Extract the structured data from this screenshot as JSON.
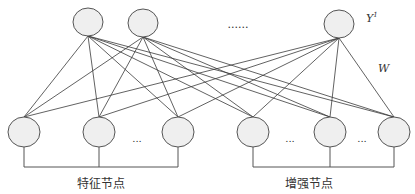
{
  "diagram": {
    "top_layer": {
      "label": "Y¹",
      "label_main": "Y",
      "label_sup": "1",
      "ellipsis": "......",
      "nodes": [
        {
          "cx": 88,
          "cy": 22
        },
        {
          "cx": 143,
          "cy": 23
        },
        {
          "cx": 339,
          "cy": 24
        }
      ]
    },
    "weights_label": "W",
    "bottom_layer": {
      "nodes": [
        {
          "cx": 24,
          "cy": 132
        },
        {
          "cx": 99,
          "cy": 132
        },
        {
          "cx": 178,
          "cy": 132
        },
        {
          "cx": 253,
          "cy": 132
        },
        {
          "cx": 330,
          "cy": 132
        },
        {
          "cx": 394,
          "cy": 132
        }
      ],
      "ellipses": [
        {
          "x": 137,
          "y": 142,
          "text": "..."
        },
        {
          "x": 290,
          "y": 142,
          "text": "..."
        },
        {
          "x": 362,
          "y": 142,
          "text": "..."
        }
      ],
      "groups": [
        {
          "label": "特征节点",
          "from": 24,
          "to": 178,
          "label_x": 101
        },
        {
          "label": "增强节点",
          "from": 253,
          "to": 394,
          "label_x": 309
        }
      ]
    },
    "colors": {
      "node_fill": "#efefef",
      "stroke": "#555555",
      "line": "#3a3a3a"
    }
  }
}
